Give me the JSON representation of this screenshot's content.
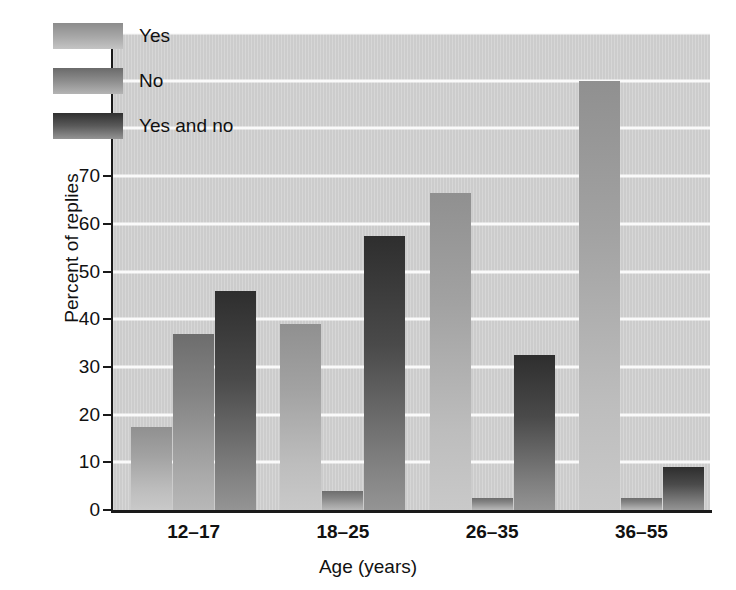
{
  "chart_data": {
    "type": "bar",
    "title": "",
    "xlabel": "Age (years)",
    "ylabel": "Percent of replies",
    "categories": [
      "12–17",
      "18–25",
      "26–35",
      "36–55"
    ],
    "series": [
      {
        "name": "Yes",
        "values": [
          17.5,
          39.0,
          66.5,
          90.0
        ]
      },
      {
        "name": "No",
        "values": [
          37.0,
          4.0,
          2.5,
          2.5
        ]
      },
      {
        "name": "Yes and no",
        "values": [
          46.0,
          57.5,
          32.5,
          9.0
        ]
      }
    ],
    "ylim": [
      0,
      100
    ],
    "yticks": [
      0,
      10,
      20,
      30,
      40,
      50,
      60,
      70,
      80,
      90,
      100
    ],
    "ytick_labels": [
      "0",
      "10",
      "20",
      "30",
      "40",
      "50",
      "60",
      "70",
      "80",
      "90",
      "100"
    ],
    "grid": "horizontal",
    "legend_position": "upper-left-inside",
    "legend": [
      "Yes",
      "No",
      "Yes and no"
    ],
    "colors": {
      "plot_background": "#cfcfcf",
      "gridline": "#fafafa",
      "axis": "#1a1a1a",
      "series_yes_top": "#909090",
      "series_yes_bottom": "#c9c9c9",
      "series_no_top": "#6d6d6d",
      "series_no_bottom": "#b8b8b8",
      "series_yesandno_top": "#2e2e2e",
      "series_yesandno_bottom": "#949494"
    }
  }
}
